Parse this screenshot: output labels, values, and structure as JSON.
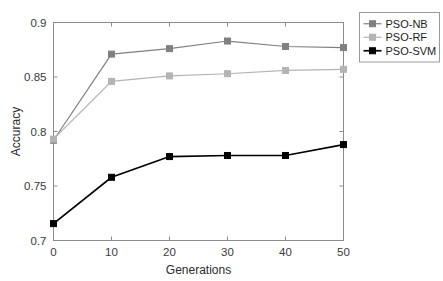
{
  "chart_data": {
    "type": "line",
    "title": "",
    "xlabel": "Generations",
    "ylabel": "Accuracy",
    "x": [
      0,
      10,
      20,
      30,
      40,
      50
    ],
    "xlim": [
      0,
      50
    ],
    "ylim": [
      0.7,
      0.9
    ],
    "xticks": [
      "0",
      "10",
      "20",
      "30",
      "40",
      "50"
    ],
    "yticks": [
      "0.7",
      "0.75",
      "0.8",
      "0.85",
      "0.9"
    ],
    "ytick_values": [
      0.7,
      0.75,
      0.8,
      0.85,
      0.9
    ],
    "grid": false,
    "legend_position": "outside-top-right",
    "series": [
      {
        "name": "PSO-NB",
        "color": "#808080",
        "marker": "square",
        "values": [
          0.792,
          0.871,
          0.876,
          0.883,
          0.878,
          0.877
        ]
      },
      {
        "name": "PSO-RF",
        "color": "#b4b4b4",
        "marker": "square",
        "values": [
          0.793,
          0.846,
          0.851,
          0.853,
          0.856,
          0.857
        ]
      },
      {
        "name": "PSO-SVM",
        "color": "#000000",
        "marker": "square",
        "values": [
          0.7155,
          0.758,
          0.777,
          0.778,
          0.778,
          0.788
        ]
      }
    ]
  },
  "legend": {
    "entries": [
      {
        "label": "PSO-NB"
      },
      {
        "label": "PSO-RF"
      },
      {
        "label": "PSO-SVM"
      }
    ]
  },
  "axes": {
    "x_title": "Generations",
    "y_title": "Accuracy"
  }
}
